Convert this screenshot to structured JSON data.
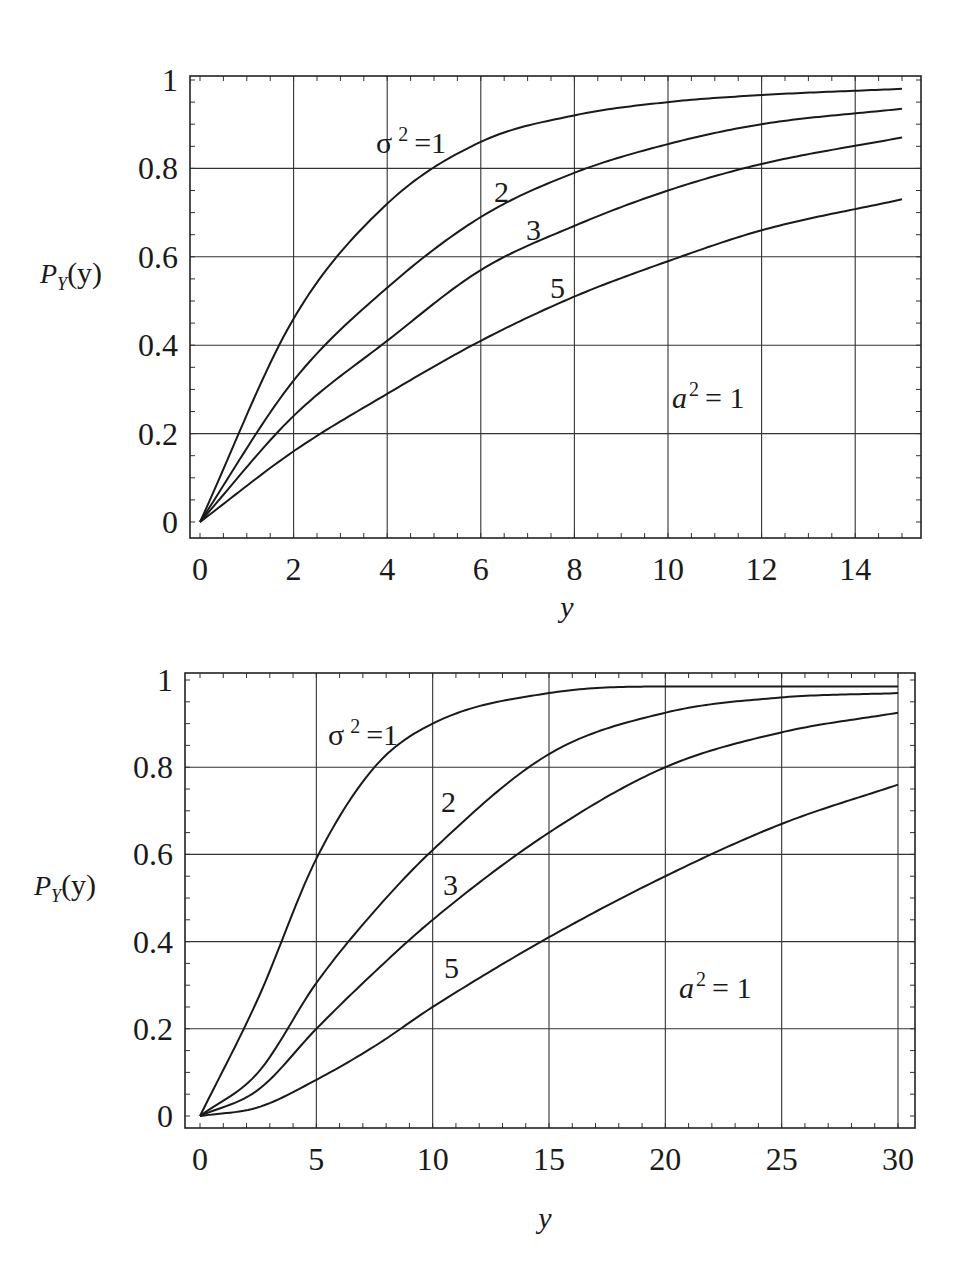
{
  "chart_data": [
    {
      "type": "line",
      "title": "",
      "xlabel": "y",
      "ylabel": "P_Y(y)",
      "xlim": [
        0,
        15
      ],
      "ylim": [
        0,
        1
      ],
      "grid": true,
      "x_ticks": [
        "0",
        "2",
        "4",
        "6",
        "8",
        "10",
        "12",
        "14"
      ],
      "y_ticks": [
        "0",
        "0.2",
        "0.4",
        "0.6",
        "0.8",
        "1"
      ],
      "annotations": [
        {
          "text": "σ² = 1",
          "series": "σ²=1"
        },
        {
          "text": "2",
          "series": "σ²=2"
        },
        {
          "text": "3",
          "series": "σ²=3"
        },
        {
          "text": "5",
          "series": "σ²=5"
        },
        {
          "text": "a² = 1",
          "role": "parameter"
        }
      ],
      "legend": "none (inline curve labels)",
      "x": [
        0,
        2,
        4,
        6,
        8,
        10,
        12,
        15
      ],
      "series": [
        {
          "name": "σ²=1",
          "values": [
            0,
            0.46,
            0.72,
            0.86,
            0.92,
            0.95,
            0.966,
            0.98
          ]
        },
        {
          "name": "σ²=2",
          "values": [
            0,
            0.32,
            0.53,
            0.69,
            0.79,
            0.855,
            0.9,
            0.935
          ]
        },
        {
          "name": "σ²=3",
          "values": [
            0,
            0.24,
            0.41,
            0.57,
            0.67,
            0.75,
            0.81,
            0.87
          ]
        },
        {
          "name": "σ²=5",
          "values": [
            0,
            0.16,
            0.29,
            0.41,
            0.51,
            0.59,
            0.66,
            0.73
          ]
        }
      ]
    },
    {
      "type": "line",
      "title": "",
      "xlabel": "y",
      "ylabel": "P_Y(y)",
      "xlim": [
        0,
        30
      ],
      "ylim": [
        0,
        1
      ],
      "grid": true,
      "x_ticks": [
        "0",
        "5",
        "10",
        "15",
        "20",
        "25",
        "30"
      ],
      "y_ticks": [
        "0",
        "0.2",
        "0.4",
        "0.6",
        "0.8",
        "1"
      ],
      "annotations": [
        {
          "text": "σ² = 1",
          "series": "σ²=1"
        },
        {
          "text": "2",
          "series": "σ²=2"
        },
        {
          "text": "3",
          "series": "σ²=3"
        },
        {
          "text": "5",
          "series": "σ²=5"
        },
        {
          "text": "a² = 1",
          "role": "parameter"
        }
      ],
      "legend": "none (inline curve labels)",
      "x": [
        0,
        2.5,
        5,
        7.5,
        10,
        15,
        20,
        25,
        30
      ],
      "series": [
        {
          "name": "σ²=1",
          "values": [
            0,
            0.27,
            0.59,
            0.8,
            0.9,
            0.97,
            0.985,
            0.985,
            0.985
          ]
        },
        {
          "name": "σ²=2",
          "values": [
            0,
            0.1,
            0.305,
            0.47,
            0.61,
            0.83,
            0.925,
            0.96,
            0.97
          ]
        },
        {
          "name": "σ²=3",
          "values": [
            0,
            0.06,
            0.2,
            0.33,
            0.45,
            0.65,
            0.8,
            0.88,
            0.925
          ]
        },
        {
          "name": "σ²=5",
          "values": [
            0,
            0.02,
            0.083,
            0.16,
            0.25,
            0.41,
            0.55,
            0.67,
            0.76
          ]
        }
      ]
    }
  ],
  "charts": [
    {
      "ylabel_main": "P",
      "ylabel_sub": "Y",
      "ylabel_arg": "(y)",
      "xlabel": "y",
      "label_sigma": "σ",
      "label_sigma_exp": "2",
      "label_sigma_eq": "=1",
      "label_2": "2",
      "label_3": "3",
      "label_5": "5",
      "label_a": "a",
      "label_a_exp": "2",
      "label_a_eq": "= 1"
    },
    {
      "ylabel_main": "P",
      "ylabel_sub": "Y",
      "ylabel_arg": "(y)",
      "xlabel": "y",
      "label_sigma": "σ",
      "label_sigma_exp": "2",
      "label_sigma_eq": "=1",
      "label_2": "2",
      "label_3": "3",
      "label_5": "5",
      "label_a": "a",
      "label_a_exp": "2",
      "label_a_eq": "= 1"
    }
  ]
}
